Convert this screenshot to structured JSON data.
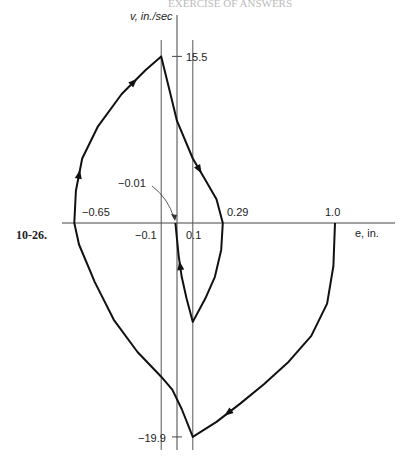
{
  "page_header": "EXERCISE OF ANSWERS",
  "figure_number": "10-26.",
  "chart_data": {
    "type": "line",
    "xlabel": "e, in.",
    "ylabel": "v, in./sec",
    "xlim": [
      -0.75,
      1.1
    ],
    "ylim": [
      -21,
      19
    ],
    "grid": false,
    "vertical_reference_lines": [
      -0.1,
      0.1
    ],
    "x_tick_labels": [
      {
        "value": -0.65,
        "label": "−0.65"
      },
      {
        "value": -0.1,
        "label": "−0.1"
      },
      {
        "value": 0.1,
        "label": "0.1"
      },
      {
        "value": 0.29,
        "label": "0.29"
      },
      {
        "value": 1.0,
        "label": "1.0"
      }
    ],
    "y_tick_labels": [
      {
        "value": 15.5,
        "label": "15.5"
      },
      {
        "value": -19.9,
        "label": "−19.9"
      }
    ],
    "annotations": [
      {
        "text": "−0.01",
        "x": -0.01,
        "y": 0
      }
    ],
    "series": [
      {
        "name": "trajectory",
        "points": [
          [
            1.0,
            0
          ],
          [
            0.99,
            -4
          ],
          [
            0.95,
            -7.5
          ],
          [
            0.85,
            -10.5
          ],
          [
            0.7,
            -13
          ],
          [
            0.55,
            -15
          ],
          [
            0.4,
            -16.8
          ],
          [
            0.25,
            -18.5
          ],
          [
            0.1,
            -19.9
          ],
          [
            0.03,
            -17.3
          ],
          [
            -0.03,
            -15.5
          ],
          [
            -0.1,
            -14.3
          ],
          [
            -0.25,
            -12
          ],
          [
            -0.4,
            -9
          ],
          [
            -0.52,
            -5.5
          ],
          [
            -0.62,
            -2
          ],
          [
            -0.65,
            0
          ],
          [
            -0.64,
            3
          ],
          [
            -0.6,
            6
          ],
          [
            -0.5,
            9
          ],
          [
            -0.35,
            12
          ],
          [
            -0.2,
            14.2
          ],
          [
            -0.1,
            15.5
          ],
          [
            -0.05,
            12.5
          ],
          [
            0.0,
            9.5
          ],
          [
            0.1,
            6
          ],
          [
            0.18,
            4
          ],
          [
            0.25,
            2.2
          ],
          [
            0.29,
            0
          ],
          [
            0.28,
            -2.5
          ],
          [
            0.24,
            -5
          ],
          [
            0.18,
            -7
          ],
          [
            0.1,
            -9.2
          ],
          [
            0.06,
            -7
          ],
          [
            0.03,
            -5
          ],
          [
            0.01,
            -3
          ],
          [
            0.0,
            -1.5
          ],
          [
            -0.01,
            0
          ]
        ],
        "arrows_at_index": [
          6,
          17,
          20,
          25,
          34
        ]
      }
    ]
  }
}
